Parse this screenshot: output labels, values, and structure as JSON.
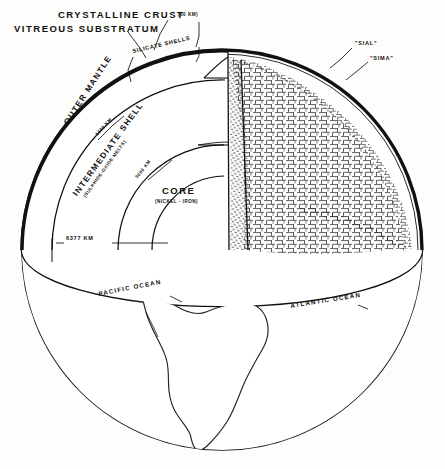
{
  "figure": {
    "background_color": "#fdfdfb",
    "ink_color": "#111111"
  },
  "labels": {
    "crystalline_crust": "CRYSTALLINE CRUST",
    "crystalline_crust_depth": "(60 KM)",
    "vitreous_substratum": "VITREOUS SUBSTRATUM",
    "silicate_shells": "SILICATE SHELLS",
    "sial": "\"SIAL\"",
    "sima": "\"SIMA\"",
    "outer_mantle": "OUTER MANTLE",
    "outer_mantle_depth": "1000 KM",
    "intermediate_shell": "INTERMEDIATE SHELL",
    "intermediate_shell_sub": "(SULPHIDE-OXIDE MELTS)",
    "intermediate_shell_depth": "3000 KM",
    "core": "CORE",
    "core_sub": "(NICKEL - IRON)",
    "earth_radius": "6377 KM",
    "pacific_ocean": "PACIFIC OCEAN",
    "atlantic_ocean": "ATLANTIC OCEAN"
  }
}
